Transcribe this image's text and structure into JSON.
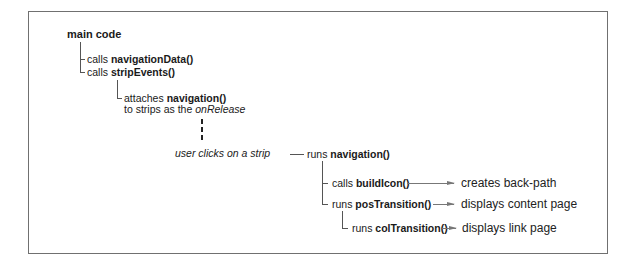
{
  "diagram": {
    "root": {
      "label": "main code"
    },
    "nodes": {
      "nav_data": {
        "verb": "calls",
        "fn": "navigationData()"
      },
      "strip_events": {
        "verb": "calls",
        "fn": "stripEvents()"
      },
      "attach": {
        "verb": "attaches",
        "fn": "navigation()",
        "line2_prefix": "to strips as the",
        "line2_em": "onRelease"
      },
      "user_click": {
        "label": "user clicks on a strip"
      },
      "run_nav": {
        "verb": "runs",
        "fn": "navigation()"
      },
      "build_icon": {
        "verb": "calls",
        "fn": "buildIcon()",
        "result": "creates back-path"
      },
      "pos_trans": {
        "verb": "runs",
        "fn": "posTransition()",
        "result": "displays content page"
      },
      "col_trans": {
        "verb": "runs",
        "fn": "colTransition()",
        "result": "displays link page"
      }
    },
    "colors": {
      "border": "#707070",
      "lines": "#555555",
      "arrows": "#777777",
      "text": "#1a1a1a"
    }
  }
}
